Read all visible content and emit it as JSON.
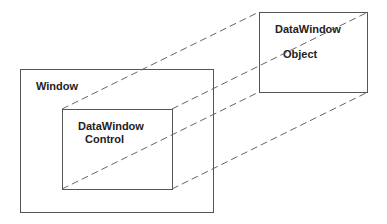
{
  "diagram": {
    "window": {
      "label": "Window"
    },
    "control": {
      "label_line1": "DataWindow",
      "label_line2": "Control"
    },
    "object": {
      "label_line1": "DataWindow",
      "label_line2": "Object"
    },
    "connector_style": "dashed",
    "relationship": "DataWindow Object projected into DataWindow Control within Window"
  }
}
